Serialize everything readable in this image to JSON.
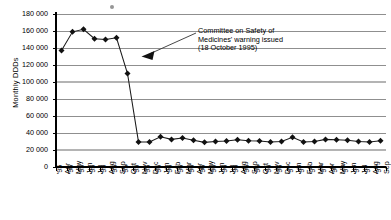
{
  "chart_data": {
    "type": "line",
    "title": "",
    "subtitle": "",
    "xlabel": "",
    "ylabel": "Monthly DDDs",
    "ylim": [
      0,
      180000
    ],
    "ytick_step": 20000,
    "ytick_labels": [
      "180 000",
      "160 000",
      "140 000",
      "120 000",
      "100 000",
      "80 000",
      "60 000",
      "40 000",
      "20 000",
      "0"
    ],
    "ytick_values": [
      180000,
      160000,
      140000,
      120000,
      100000,
      80000,
      60000,
      40000,
      20000,
      0
    ],
    "grid": true,
    "legend": null,
    "marker": "diamond",
    "categories": [
      "Apr '95",
      "May '95",
      "Jun '95",
      "Jul '95",
      "Aug '95",
      "Sep '95",
      "Oct '95",
      "Nov '95",
      "Dec '95",
      "Jan '96",
      "Feb '96",
      "Mar '96",
      "Apr '96",
      "May '96",
      "Jun '96",
      "Jul '96",
      "Aug '96",
      "Sep '96",
      "Oct '96",
      "Nov '96",
      "Dec '96",
      "Jan '97",
      "Feb '97",
      "Mar '97",
      "Apr '97",
      "May '97",
      "Jun '97",
      "Jul '97",
      "Aug '97",
      "Sep '97"
    ],
    "values": [
      137000,
      159000,
      162000,
      151000,
      150000,
      152000,
      110000,
      29500,
      29500,
      35500,
      32500,
      34000,
      31500,
      29000,
      30000,
      30500,
      32000,
      31000,
      30500,
      29500,
      30000,
      35000,
      29500,
      30000,
      32500,
      32000,
      31500,
      30000,
      29500,
      31000
    ],
    "annotations": [
      {
        "name": "csm-warning-note",
        "lines": [
          "Committee on Safety of",
          "Medicines' warning issued",
          "(18 October 1995)"
        ],
        "points_to_category": "Oct '95",
        "arrow": true
      }
    ]
  },
  "artifacts": {
    "smudge_label": "scan-artifact"
  }
}
